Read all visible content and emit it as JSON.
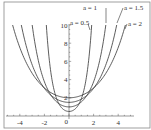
{
  "chart_data": {
    "type": "line",
    "title": "",
    "xlabel": "",
    "ylabel": "",
    "function": "y = a·cosh(x/a)",
    "xlim": [
      -5,
      5
    ],
    "ylim": [
      0,
      10
    ],
    "grid": false,
    "x_ticks": [
      -4,
      -2,
      0,
      2,
      4
    ],
    "x_tick_labels": [
      "-4",
      "-2",
      "0",
      "2",
      "4"
    ],
    "y_ticks": [
      2,
      4,
      6,
      8,
      10
    ],
    "y_tick_labels": [
      "2",
      "4",
      "6",
      "8",
      "10"
    ],
    "series": [
      {
        "name": "a = 0.5",
        "a": 0.5,
        "label": "a = 0.5"
      },
      {
        "name": "a = 1",
        "a": 1,
        "label": "a = 1"
      },
      {
        "name": "a = 1.5",
        "a": 1.5,
        "label": "a = 1.5"
      },
      {
        "name": "a = 2",
        "a": 2,
        "label": "a = 2"
      }
    ],
    "origin_label": "0"
  }
}
